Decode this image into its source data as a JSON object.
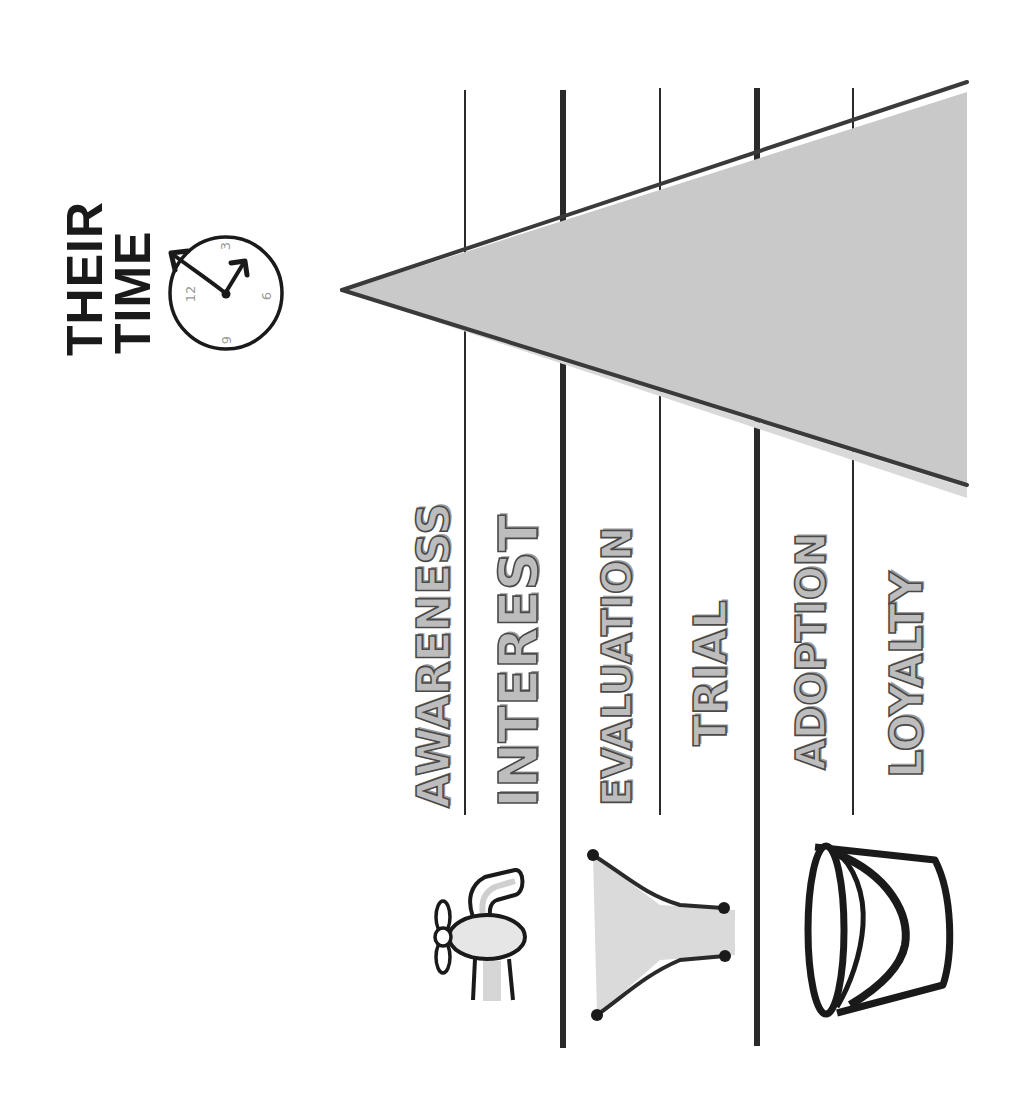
{
  "title": {
    "line1": "THEIR",
    "line2": "TIME"
  },
  "clock": {
    "icon": "clock-icon",
    "numbers": [
      "12",
      "3",
      "6",
      "9"
    ]
  },
  "stages": [
    {
      "label": "AWARENESS",
      "style": "outline"
    },
    {
      "label": "INTEREST",
      "style": "outline"
    },
    {
      "label": "EVALUATION",
      "style": "outline"
    },
    {
      "label": "TRIAL",
      "style": "outline"
    },
    {
      "label": "ADOPTION",
      "style": "outline"
    },
    {
      "label": "LOYALTY",
      "style": "outline"
    }
  ],
  "groups": [
    {
      "name": "tap",
      "icon": "tap-icon",
      "stages": [
        "AWARENESS",
        "INTEREST"
      ]
    },
    {
      "name": "funnel",
      "icon": "funnel-icon",
      "stages": [
        "EVALUATION",
        "TRIAL"
      ]
    },
    {
      "name": "bucket",
      "icon": "bucket-icon",
      "stages": [
        "ADOPTION",
        "LOYALTY"
      ]
    }
  ],
  "wedge": {
    "label": "time-wedge",
    "fill": "#c9c9c9",
    "stroke": "#3a3a3a"
  },
  "colors": {
    "line": "#2a2a2a",
    "stage_fill": "#bdbdbd",
    "stage_stroke": "#4a4a4a",
    "text": "#1a1a1a"
  }
}
